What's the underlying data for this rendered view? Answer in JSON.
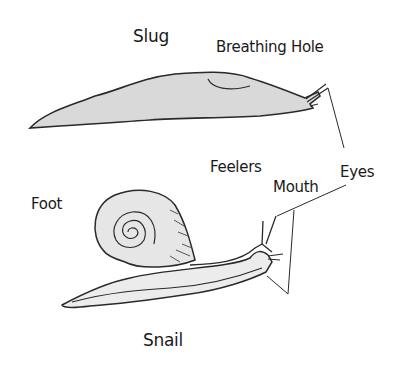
{
  "diagram": {
    "labels": {
      "slug": "Slug",
      "breathing_hole": "Breathing Hole",
      "feelers": "Feelers",
      "eyes": "Eyes",
      "mouth": "Mouth",
      "foot": "Foot",
      "snail": "Snail"
    },
    "colors": {
      "outline": "#2a2a2a",
      "slug_fill": "#d9d9d9",
      "shell_fill": "#e6e6e6",
      "snail_body_fill": "#ececec"
    }
  }
}
